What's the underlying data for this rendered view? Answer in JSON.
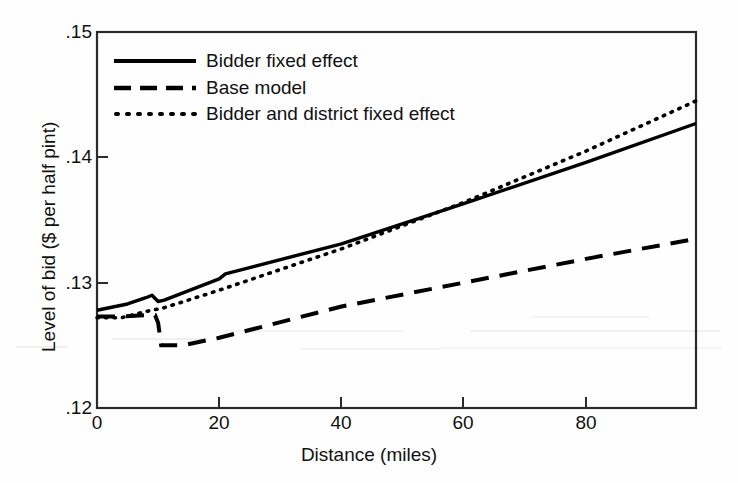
{
  "chart_data": {
    "type": "line",
    "title": "",
    "xlabel": "Distance (miles)",
    "ylabel": "Level of bid ($ per half pint)",
    "xlim": [
      0,
      98
    ],
    "ylim": [
      0.12,
      0.15
    ],
    "xticks": [
      "0",
      "20",
      "40",
      "60",
      "80"
    ],
    "xtick_values": [
      0,
      20,
      40,
      60,
      80
    ],
    "yticks": [
      ".15",
      ".14",
      ".13",
      ".12"
    ],
    "ytick_values": [
      0.15,
      0.14,
      0.13,
      0.12
    ],
    "grid": false,
    "legend_position": "upper-left inside plot area",
    "series": [
      {
        "name": "Bidder fixed effect",
        "style": "solid",
        "color": "#000000",
        "x": [
          0,
          5,
          8,
          9,
          10,
          11,
          20,
          21,
          40,
          60,
          80,
          98
        ],
        "y": [
          0.1278,
          0.1283,
          0.1288,
          0.129,
          0.1285,
          0.1286,
          0.1303,
          0.1307,
          0.1331,
          0.1363,
          0.1396,
          0.1427
        ]
      },
      {
        "name": "Base model",
        "style": "dashed",
        "color": "#000000",
        "x": [
          0,
          4,
          8,
          9.5,
          10,
          10.5,
          14,
          20,
          40,
          60,
          80,
          98
        ],
        "y": [
          0.1273,
          0.1273,
          0.1274,
          0.1274,
          0.1268,
          0.125,
          0.125,
          0.1256,
          0.1281,
          0.13,
          0.1319,
          0.1335
        ]
      },
      {
        "name": "Bidder and district fixed effect",
        "style": "dotted",
        "color": "#000000",
        "x": [
          0,
          4,
          8,
          10,
          11,
          20,
          40,
          60,
          80,
          98
        ],
        "y": [
          0.1272,
          0.1272,
          0.1277,
          0.1279,
          0.128,
          0.1294,
          0.1327,
          0.1364,
          0.1405,
          0.1445
        ]
      }
    ]
  },
  "legend": {
    "items": [
      {
        "label": "Bidder fixed effect",
        "style": "solid"
      },
      {
        "label": "Base model",
        "style": "dashed"
      },
      {
        "label": "Bidder and district fixed effect",
        "style": "dotted"
      }
    ]
  },
  "axes": {
    "y_title": "Level of bid ($ per half pint)",
    "x_title": "Distance (miles)",
    "y_labels": [
      ".15",
      ".14",
      ".13",
      ".12"
    ],
    "x_labels": [
      "0",
      "20",
      "40",
      "60",
      "80"
    ]
  },
  "colors": {
    "line": "#000000",
    "frame": "#2b2b2b",
    "background": "#fefefe",
    "text": "#111111"
  }
}
